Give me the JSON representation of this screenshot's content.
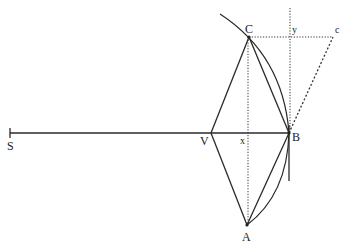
{
  "diagram": {
    "title": "",
    "points": {
      "S": {
        "label": "S",
        "x": 10,
        "y": 133
      },
      "V": {
        "label": "V",
        "x": 211,
        "y": 133
      },
      "x": {
        "label": "x",
        "x": 248,
        "y": 133
      },
      "B": {
        "label": "B",
        "x": 289,
        "y": 133
      },
      "C": {
        "label": "C",
        "x": 249,
        "y": 37
      },
      "A": {
        "label": "A",
        "x": 247,
        "y": 225
      },
      "y": {
        "label": "y",
        "x": 290,
        "y": 37
      },
      "c": {
        "label": "c",
        "x": 333,
        "y": 37
      }
    },
    "labels": {
      "S": "S",
      "V": "V",
      "x": "x",
      "B": "B",
      "C": "C",
      "A": "A",
      "y": "y",
      "c": "c"
    },
    "segments": {
      "solid": [
        "SB",
        "VC",
        "VA",
        "CB",
        "AB",
        "tangent at B"
      ],
      "dotted": [
        "CA (vertical through x)",
        "Cc (horizontal through y)",
        "vertical line through y and B"
      ],
      "dashed": [
        "Bc"
      ],
      "arcs": [
        "arc through C and B (upper)",
        "arc from B to A (lower)"
      ]
    }
  }
}
